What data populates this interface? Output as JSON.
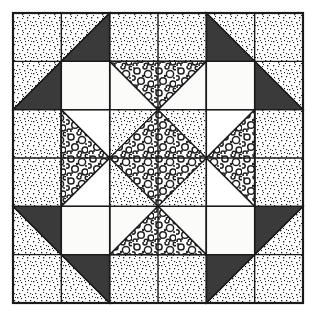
{
  "figure": {
    "width": 315,
    "height": 317
  },
  "colors": {
    "background": "#ffffff",
    "outline": "#1a1a1a",
    "dark_fabric": "#3a3a3a",
    "plain_fabric": "#fbfbf9",
    "stipple_fabric": "#ffffff",
    "stipple_dot": "#252525",
    "bubble_fabric": "#ffffff",
    "bubble_ink": "#1f1f1f"
  },
  "geometry": {
    "frame_x": 13,
    "frame_y": 13,
    "frame_size": 290,
    "grid_divisions": 6,
    "cell_size": 48.333,
    "stroke_width": 1.4,
    "frame_stroke_width": 2.2
  },
  "legend": {
    "fabrics": [
      {
        "key": "dark",
        "label": "Dark solid fabric"
      },
      {
        "key": "stipple",
        "label": "Fine speckled print fabric"
      },
      {
        "key": "bubble",
        "label": "Coarse circle print fabric"
      },
      {
        "key": "plain",
        "label": "Plain light fabric"
      }
    ]
  },
  "patches": [
    {
      "name": "corner-unit-top-left-light",
      "fabric": "stipple",
      "points": "0,0 2,0 0,2"
    },
    {
      "name": "corner-unit-top-left-dark",
      "fabric": "dark",
      "points": "2,0 2,2 0,2"
    },
    {
      "name": "corner-unit-top-right-light",
      "fabric": "stipple",
      "points": "6,0 6,2 4,0"
    },
    {
      "name": "corner-unit-top-right-dark",
      "fabric": "dark",
      "points": "4,0 6,2 4,2"
    },
    {
      "name": "corner-unit-bottom-left-light",
      "fabric": "stipple",
      "points": "0,6 0,4 2,6"
    },
    {
      "name": "corner-unit-bottom-left-dark",
      "fabric": "dark",
      "points": "0,4 2,4 2,6"
    },
    {
      "name": "corner-unit-bottom-right-light",
      "fabric": "stipple",
      "points": "6,6 4,6 6,4"
    },
    {
      "name": "corner-unit-bottom-right-dark",
      "fabric": "dark",
      "points": "4,4 6,4 4,6"
    },
    {
      "name": "edge-band-top",
      "fabric": "stipple",
      "points": "2,0 4,0 4,1 2,1"
    },
    {
      "name": "edge-band-bottom",
      "fabric": "stipple",
      "points": "2,5 4,5 4,6 2,6"
    },
    {
      "name": "edge-band-left",
      "fabric": "stipple",
      "points": "0,2 1,2 1,4 0,4"
    },
    {
      "name": "edge-band-right",
      "fabric": "stipple",
      "points": "5,2 6,2 6,4 5,4"
    },
    {
      "name": "star-point-top-plain-left",
      "fabric": "plain",
      "points": "2,1 3,2 2,2"
    },
    {
      "name": "star-point-top-plain-right",
      "fabric": "plain",
      "points": "4,1 4,2 3,2"
    },
    {
      "name": "star-point-top-print",
      "fabric": "bubble",
      "points": "2,1 4,1 3,2"
    },
    {
      "name": "star-point-bottom-plain-left",
      "fabric": "plain",
      "points": "2,5 2,4 3,4"
    },
    {
      "name": "star-point-bottom-plain-right",
      "fabric": "plain",
      "points": "4,5 3,4 4,4"
    },
    {
      "name": "star-point-bottom-print",
      "fabric": "bubble",
      "points": "2,5 3,4 4,5"
    },
    {
      "name": "star-point-left-plain-top",
      "fabric": "plain",
      "points": "1,2 2,3 1,3"
    },
    {
      "name": "star-point-left-plain-bottom",
      "fabric": "plain",
      "points": "1,4 1,3 2,3"
    },
    {
      "name": "star-point-left-print",
      "fabric": "bubble",
      "points": "1,2 2,3 1,4"
    },
    {
      "name": "star-point-right-plain-top",
      "fabric": "plain",
      "points": "5,2 5,3 4,3"
    },
    {
      "name": "star-point-right-plain-bottom",
      "fabric": "plain",
      "points": "5,4 4,3 5,3"
    },
    {
      "name": "star-point-right-print",
      "fabric": "bubble",
      "points": "5,2 5,4 4,3"
    },
    {
      "name": "plain-square-top-left",
      "fabric": "plain",
      "points": "1,1 2,1 2,2 1,2"
    },
    {
      "name": "plain-square-top-right",
      "fabric": "plain",
      "points": "4,1 5,1 5,2 4,2"
    },
    {
      "name": "plain-square-bottom-left",
      "fabric": "plain",
      "points": "1,4 2,4 2,5 1,5"
    },
    {
      "name": "plain-square-bottom-right",
      "fabric": "plain",
      "points": "4,4 5,4 5,5 4,5"
    },
    {
      "name": "center-background-square",
      "fabric": "stipple",
      "points": "2,2 4,2 4,4 2,4"
    },
    {
      "name": "center-diamond",
      "fabric": "bubble",
      "points": "3,2 4,3 3,4 2,3"
    }
  ],
  "grid_lines": {
    "name": "patch-seam-lines",
    "vertical": [
      1,
      2,
      3,
      4,
      5
    ],
    "horizontal": [
      1,
      2,
      3,
      4,
      5
    ]
  }
}
